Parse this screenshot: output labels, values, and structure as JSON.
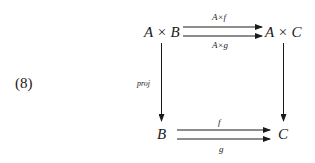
{
  "equation_number": "(8)",
  "nodes": {
    "top_left": "A × B",
    "top_right": "A × C",
    "bottom_left": "B",
    "bottom_right": "C"
  },
  "arrows": {
    "top_upper": {
      "label": "A×f",
      "from": "A × B",
      "to": "A × C"
    },
    "top_lower": {
      "label": "A×g",
      "from": "A × B",
      "to": "A × C"
    },
    "left_vertical": {
      "label": "proj",
      "from": "A × B",
      "to": "B"
    },
    "right_vertical": {
      "label": "",
      "from": "A × C",
      "to": "C"
    },
    "bottom_upper": {
      "label": "f",
      "from": "B",
      "to": "C"
    },
    "bottom_lower": {
      "label": "g",
      "from": "B",
      "to": "C"
    }
  },
  "colors": {
    "ink": "#1a1a1a",
    "background": "#ffffff"
  }
}
